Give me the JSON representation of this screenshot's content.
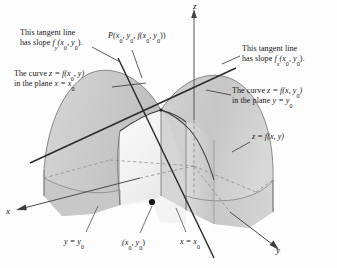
{
  "figure": {
    "type": "3d-surface-diagram",
    "background_color": "#fdfdfd",
    "ink_color": "#1a1a1a",
    "surface_fill": "#cfcfcf",
    "plane_fill": "#d9d9d9"
  },
  "axes": {
    "z": "z",
    "x": "x",
    "y": "y"
  },
  "annotations": {
    "tangent_left_line1": "This tangent line",
    "tangent_left_line2_pre": "has slope ",
    "tangent_left_slope_f": "f",
    "tangent_left_slope_sub": "y",
    "tangent_left_slope_args": "(x",
    "tangent_left_sub0a": "0",
    "tangent_left_mid": ", y",
    "tangent_left_sub0b": "0",
    "tangent_left_end": ").",
    "tangent_right_line1": "This tangent line",
    "tangent_right_line2_pre": "has slope ",
    "tangent_right_slope_f": "f",
    "tangent_right_slope_sub": "x",
    "tangent_right_slope_args": "(x",
    "tangent_right_sub0a": "0",
    "tangent_right_mid": ", y",
    "tangent_right_sub0b": "0",
    "tangent_right_end": ").",
    "point_P_label": "P(x",
    "point_P_sub1": "0",
    "point_P_mid1": ", y",
    "point_P_sub2": "0",
    "point_P_mid2": ", f(x",
    "point_P_sub3": "0",
    "point_P_mid3": ", y",
    "point_P_sub4": "0",
    "point_P_end": "))",
    "curve_left_line1_pre": "The curve ",
    "curve_left_line1_expr": "z = f(x",
    "curve_left_line1_sub": "0",
    "curve_left_line1_end": ", y)",
    "curve_left_line2_pre": "in the plane ",
    "curve_left_line2_expr": "x = x",
    "curve_left_line2_sub": "0",
    "curve_right_line1_pre": "The curve ",
    "curve_right_line1_expr": "z = f(x, y",
    "curve_right_line1_sub": "0",
    "curve_right_line1_end": ")",
    "curve_right_line2_pre": "in the plane ",
    "curve_right_line2_expr": "y = y",
    "curve_right_line2_sub": "0",
    "surface_label_expr": "z = f(x, y)",
    "base_y_expr": "y = y",
    "base_y_sub": "0",
    "base_point_open": "(x",
    "base_point_sub1": "0",
    "base_point_mid": ", y",
    "base_point_sub2": "0",
    "base_point_close": ")",
    "base_x_expr": "x = x",
    "base_x_sub": "0"
  }
}
